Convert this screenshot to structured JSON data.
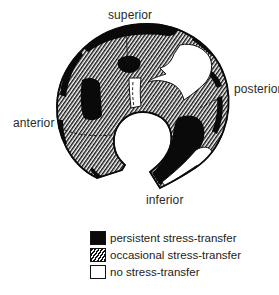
{
  "diagram": {
    "type": "anatomical region map",
    "orientation_labels": {
      "superior": "superior",
      "posterior": "posterior",
      "anterior": "anterior",
      "inferior": "inferior"
    },
    "legend": [
      {
        "pattern": "solid",
        "label": "persistent stress-transfer",
        "color": "#0a0a0a"
      },
      {
        "pattern": "hatched",
        "label": "occasional stress-transfer",
        "color": "#111111"
      },
      {
        "pattern": "empty",
        "label": "no stress-transfer",
        "color": "#ffffff"
      }
    ]
  }
}
